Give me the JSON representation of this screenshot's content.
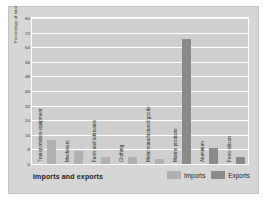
{
  "chart_data": {
    "type": "bar",
    "title": "",
    "xlabel": "Imports and exports",
    "ylabel": "Percentage of total",
    "ylim": [
      0,
      80
    ],
    "ytick_labels": [
      "80",
      "72",
      "64",
      "56",
      "48",
      "40",
      "32",
      "24",
      "16",
      "8",
      "0"
    ],
    "ytick_values": [
      80,
      72,
      64,
      56,
      48,
      40,
      32,
      24,
      16,
      8,
      0
    ],
    "grid": true,
    "legend_position": "bottom-right",
    "categories": [
      "Transportation equipment",
      "Machinery",
      "Fuels and lubricants",
      "Clothing",
      "Metal manufactured goods",
      "Marine products",
      "Aluminum",
      "Ferro-silicon"
    ],
    "series": [
      {
        "name": "Imports",
        "color": "#b0b0b0",
        "values": [
          13,
          7,
          4,
          4,
          3,
          null,
          null,
          null
        ]
      },
      {
        "name": "Exports",
        "color": "#8a8a8a",
        "values": [
          null,
          null,
          null,
          null,
          null,
          69,
          9,
          4
        ]
      }
    ]
  },
  "legend": {
    "items": [
      {
        "label": "Imports",
        "color": "#b0b0b0"
      },
      {
        "label": "Exports",
        "color": "#8a8a8a"
      }
    ]
  }
}
